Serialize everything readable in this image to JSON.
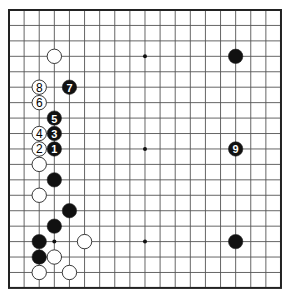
{
  "board": {
    "size": 19,
    "visible_cols": 19,
    "origin_x": 9,
    "origin_y": 10,
    "spacing_x": 15.11,
    "spacing_y": 15.44,
    "line_color": "#555555",
    "border_color": "#222222",
    "background": "#ffffff",
    "star_points": [
      [
        3,
        3
      ],
      [
        9,
        3
      ],
      [
        15,
        3
      ],
      [
        3,
        9
      ],
      [
        9,
        9
      ],
      [
        15,
        9
      ],
      [
        3,
        15
      ],
      [
        9,
        15
      ],
      [
        15,
        15
      ]
    ]
  },
  "stones": [
    {
      "color": "white",
      "col": 3,
      "row": 3,
      "label": ""
    },
    {
      "color": "black",
      "col": 15,
      "row": 3,
      "label": ""
    },
    {
      "color": "white",
      "col": 2,
      "row": 5,
      "label": "8"
    },
    {
      "color": "black",
      "col": 4,
      "row": 5,
      "label": "7"
    },
    {
      "color": "white",
      "col": 2,
      "row": 6,
      "label": "6"
    },
    {
      "color": "black",
      "col": 3,
      "row": 7,
      "label": "5"
    },
    {
      "color": "white",
      "col": 2,
      "row": 8,
      "label": "4"
    },
    {
      "color": "black",
      "col": 3,
      "row": 8,
      "label": "3"
    },
    {
      "color": "white",
      "col": 2,
      "row": 9,
      "label": "2"
    },
    {
      "color": "black",
      "col": 3,
      "row": 9,
      "label": "1"
    },
    {
      "color": "black",
      "col": 15,
      "row": 9,
      "label": "9"
    },
    {
      "color": "white",
      "col": 2,
      "row": 10,
      "label": ""
    },
    {
      "color": "black",
      "col": 3,
      "row": 11,
      "label": ""
    },
    {
      "color": "white",
      "col": 2,
      "row": 12,
      "label": ""
    },
    {
      "color": "black",
      "col": 4,
      "row": 13,
      "label": ""
    },
    {
      "color": "black",
      "col": 3,
      "row": 14,
      "label": ""
    },
    {
      "color": "black",
      "col": 2,
      "row": 15,
      "label": ""
    },
    {
      "color": "white",
      "col": 5,
      "row": 15,
      "label": ""
    },
    {
      "color": "black",
      "col": 15,
      "row": 15,
      "label": ""
    },
    {
      "color": "black",
      "col": 2,
      "row": 16,
      "label": ""
    },
    {
      "color": "white",
      "col": 3,
      "row": 16,
      "label": ""
    },
    {
      "color": "white",
      "col": 2,
      "row": 17,
      "label": ""
    },
    {
      "color": "white",
      "col": 4,
      "row": 17,
      "label": ""
    }
  ]
}
